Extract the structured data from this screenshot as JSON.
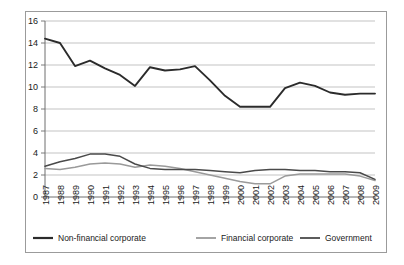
{
  "chart_data": {
    "type": "line",
    "title": "",
    "xlabel": "",
    "ylabel": "",
    "ylim": [
      0,
      16
    ],
    "ytick_step": 2,
    "yticks": [
      0,
      2,
      4,
      6,
      8,
      10,
      12,
      14,
      16
    ],
    "grid": true,
    "legend_position": "bottom",
    "categories": [
      "1987",
      "1988",
      "1989",
      "1990",
      "1991",
      "1992",
      "1993",
      "1994",
      "1995",
      "1996",
      "1997",
      "1998",
      "1999",
      "2000",
      "2001",
      "2002",
      "2003",
      "2004",
      "2005",
      "2006",
      "2007",
      "2008",
      "2009"
    ],
    "series": [
      {
        "name": "Non-financial corporate",
        "color": "#2b2b2b",
        "width": 1.9,
        "values": [
          14.4,
          14.0,
          11.9,
          12.4,
          11.7,
          11.1,
          10.1,
          11.8,
          11.5,
          11.6,
          11.9,
          10.6,
          9.2,
          8.2,
          8.2,
          8.2,
          9.9,
          10.4,
          10.1,
          9.5,
          9.3,
          9.4,
          9.4
        ]
      },
      {
        "name": "Financial corporate",
        "color": "#9a9a9a",
        "width": 1.5,
        "values": [
          2.6,
          2.5,
          2.7,
          3.0,
          3.1,
          3.0,
          2.7,
          2.9,
          2.8,
          2.6,
          2.3,
          2.0,
          1.7,
          1.4,
          1.2,
          1.2,
          1.9,
          2.1,
          2.1,
          2.1,
          2.1,
          1.9,
          1.5
        ]
      },
      {
        "name": "Government",
        "color": "#4a4a4a",
        "width": 1.5,
        "values": [
          2.8,
          3.2,
          3.5,
          3.9,
          3.9,
          3.7,
          3.0,
          2.6,
          2.5,
          2.5,
          2.5,
          2.4,
          2.3,
          2.2,
          2.4,
          2.5,
          2.5,
          2.4,
          2.4,
          2.3,
          2.3,
          2.2,
          1.6
        ]
      }
    ]
  },
  "legend": {
    "items": [
      {
        "label": "Non-financial corporate"
      },
      {
        "label": "Financial corporate"
      },
      {
        "label": "Government"
      }
    ]
  }
}
